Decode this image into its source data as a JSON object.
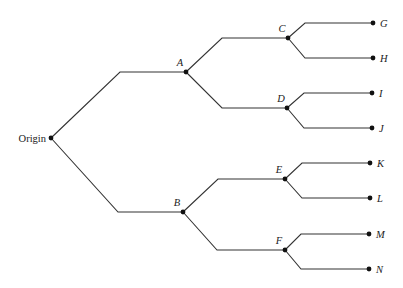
{
  "diagram": {
    "type": "tree",
    "orientation": "left-to-right",
    "root": "Origin",
    "nodes": [
      {
        "id": "Origin",
        "label": "Origin",
        "x": 51,
        "y": 138,
        "label_pos": "left",
        "italic": false
      },
      {
        "id": "A",
        "label": "A",
        "x": 186,
        "y": 72,
        "label_pos": "above-left",
        "italic": true
      },
      {
        "id": "B",
        "label": "B",
        "x": 183,
        "y": 212,
        "label_pos": "above-left",
        "italic": true
      },
      {
        "id": "C",
        "label": "C",
        "x": 288,
        "y": 38,
        "label_pos": "above-left",
        "italic": true
      },
      {
        "id": "D",
        "label": "D",
        "x": 287,
        "y": 108,
        "label_pos": "above-left",
        "italic": true
      },
      {
        "id": "E",
        "label": "E",
        "x": 285,
        "y": 179,
        "label_pos": "above-left",
        "italic": true
      },
      {
        "id": "F",
        "label": "F",
        "x": 285,
        "y": 250,
        "label_pos": "above-left",
        "italic": true
      },
      {
        "id": "G",
        "label": "G",
        "x": 373,
        "y": 23,
        "label_pos": "right",
        "italic": true
      },
      {
        "id": "H",
        "label": "H",
        "x": 373,
        "y": 58,
        "label_pos": "right",
        "italic": true
      },
      {
        "id": "I",
        "label": "I",
        "x": 372,
        "y": 93,
        "label_pos": "right",
        "italic": true
      },
      {
        "id": "J",
        "label": "J",
        "x": 372,
        "y": 128,
        "label_pos": "right",
        "italic": true
      },
      {
        "id": "K",
        "label": "K",
        "x": 370,
        "y": 163,
        "label_pos": "right",
        "italic": true
      },
      {
        "id": "L",
        "label": "L",
        "x": 370,
        "y": 198,
        "label_pos": "right",
        "italic": true
      },
      {
        "id": "M",
        "label": "M",
        "x": 369,
        "y": 234,
        "label_pos": "right",
        "italic": true
      },
      {
        "id": "N",
        "label": "N",
        "x": 369,
        "y": 269,
        "label_pos": "right",
        "italic": true
      }
    ],
    "edges": [
      {
        "from": "Origin",
        "to": "A",
        "bend_x": 120
      },
      {
        "from": "Origin",
        "to": "B",
        "bend_x": 118
      },
      {
        "from": "A",
        "to": "C",
        "bend_x": 222
      },
      {
        "from": "A",
        "to": "D",
        "bend_x": 222
      },
      {
        "from": "B",
        "to": "E",
        "bend_x": 218
      },
      {
        "from": "B",
        "to": "F",
        "bend_x": 217
      },
      {
        "from": "C",
        "to": "G",
        "bend_x": 305
      },
      {
        "from": "C",
        "to": "H",
        "bend_x": 305
      },
      {
        "from": "D",
        "to": "I",
        "bend_x": 304
      },
      {
        "from": "D",
        "to": "J",
        "bend_x": 304
      },
      {
        "from": "E",
        "to": "K",
        "bend_x": 302
      },
      {
        "from": "E",
        "to": "L",
        "bend_x": 302
      },
      {
        "from": "F",
        "to": "M",
        "bend_x": 301
      },
      {
        "from": "F",
        "to": "N",
        "bend_x": 301
      }
    ]
  }
}
